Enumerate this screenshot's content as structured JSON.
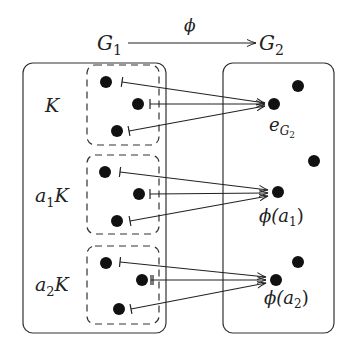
{
  "top": {
    "source_label": "G",
    "source_sub": "1",
    "map_label": "ϕ",
    "target_label": "G",
    "target_sub": "2"
  },
  "left_box": {
    "cosets": [
      {
        "label_prefix": "",
        "label_sub": "",
        "label_main": "K"
      },
      {
        "label_prefix": "a",
        "label_sub": "1",
        "label_main": "K"
      },
      {
        "label_prefix": "a",
        "label_sub": "2",
        "label_main": "K"
      }
    ]
  },
  "right_box": {
    "images": [
      {
        "label_main": "e",
        "label_sub": "G",
        "label_subsub": "2"
      },
      {
        "label_main": "ϕ(a",
        "label_sub": "1",
        "label_close": ")"
      },
      {
        "label_main": "ϕ(a",
        "label_sub": "2",
        "label_close": ")"
      }
    ]
  },
  "colors": {
    "ink": "#222222",
    "background": "#ffffff"
  }
}
